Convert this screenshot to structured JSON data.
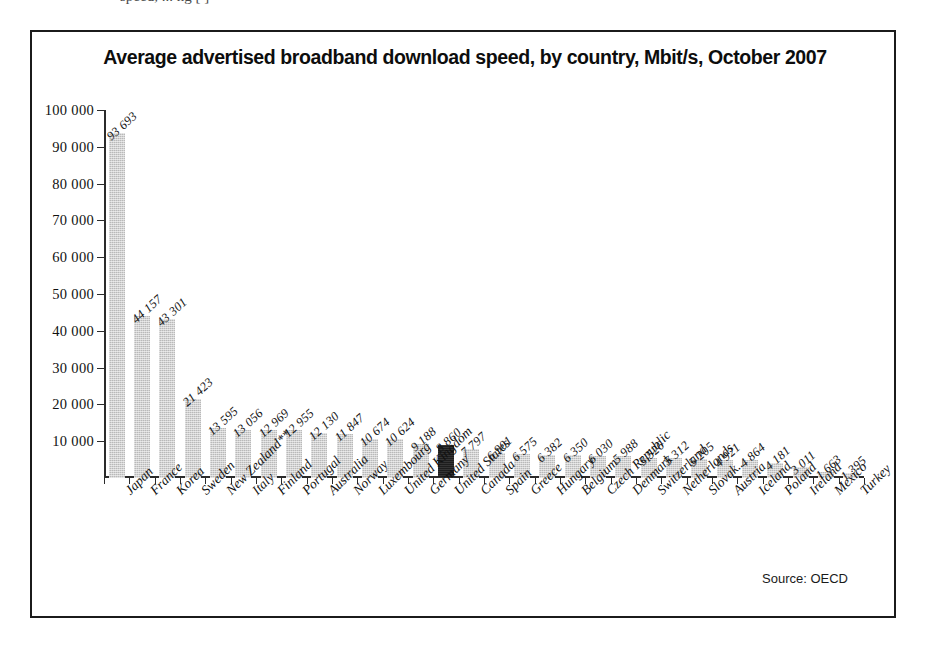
{
  "top_strip": {
    "partial_text": "speed, ... ng [ ]"
  },
  "figure": {
    "title": "Average advertised broadband download speed, by country, Mbit/s, October 2007",
    "source_note": "Source: OECD"
  },
  "chart_data": {
    "type": "bar",
    "title": "Average advertised broadband download speed, by country, Mbit/s, October 2007",
    "xlabel": "",
    "ylabel": "",
    "ylim": [
      0,
      100000
    ],
    "ytick_step": 10000,
    "ytick_labels": [
      "10 000",
      "20 000",
      "30 000",
      "40 000",
      "50 000",
      "60 000",
      "70 000",
      "80 000",
      "90 000",
      "100 000"
    ],
    "ytick_values": [
      10000,
      20000,
      30000,
      40000,
      50000,
      60000,
      70000,
      80000,
      90000,
      100000
    ],
    "grid": false,
    "legend": false,
    "highlight_category": "United States",
    "bar_color": "#b9b9b9",
    "highlight_color": "#1d1d1d",
    "categories": [
      "Japan",
      "France",
      "Korea",
      "Sweden",
      "New Zealand**",
      "Italy",
      "Finland",
      "Portugal",
      "Australia",
      "Norway",
      "Luxembourg",
      "United Kingdom",
      "Germany",
      "United States",
      "Canada",
      "Spain",
      "Greece",
      "Hungary",
      "Belgium",
      "Czech Republic",
      "Denmark",
      "Switzerland",
      "Netherlands",
      "Slovak..",
      "Austria",
      "Iceland",
      "Poland",
      "Ireland",
      "Mexico",
      "Turkey"
    ],
    "values": [
      93693,
      44157,
      43301,
      21423,
      13595,
      13056,
      12969,
      12955,
      12130,
      11847,
      10674,
      10624,
      9188,
      8860,
      7797,
      6901,
      6575,
      6382,
      6350,
      6030,
      5988,
      5526,
      5312,
      5205,
      4921,
      4864,
      4181,
      3011,
      1663,
      1395
    ],
    "value_labels": [
      "93 693",
      "44 157",
      "43 301",
      "21 423",
      "13 595",
      "13 056",
      "12 969",
      "12 955",
      "12 130",
      "11 847",
      "10 674",
      "10 624",
      "9 188",
      "8 860",
      "7 797",
      "6 901",
      "6 575",
      "6 382",
      "6 350",
      "6 030",
      "5 988",
      "5 526",
      "5 312",
      "5 205",
      "4 921",
      "4 864",
      "4 181",
      "3 011",
      "1 663",
      "1 395"
    ]
  }
}
